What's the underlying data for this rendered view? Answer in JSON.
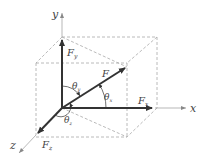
{
  "diagram": {
    "colors": {
      "vector": "#333333",
      "axis": "#9a9a9a",
      "dashed": "#a8a8a8",
      "text": "#444444",
      "background": "#ffffff"
    },
    "axes": {
      "x_label": "x",
      "y_label": "y",
      "z_label": "z"
    },
    "vectors": {
      "resultant": "F",
      "fx": "F",
      "fx_sub": "x",
      "fy": "F",
      "fy_sub": "y",
      "fz": "F",
      "fz_sub": "z"
    },
    "angles": {
      "theta_x": "θ",
      "theta_x_sub": "x",
      "theta_y": "θ",
      "theta_y_sub": "y",
      "theta_z": "θ",
      "theta_z_sub": "z"
    }
  }
}
